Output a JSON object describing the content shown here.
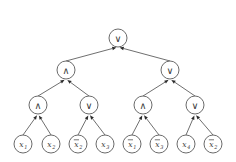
{
  "figure": {
    "background_color": "#ffffff",
    "stroke_color": "#4a4a4a",
    "node_fill": "#ffffff",
    "text_color": "#3a3a3a"
  },
  "symbols": {
    "and": "∧",
    "or": "∨",
    "variable": "x"
  },
  "gates": [
    {
      "id": "root",
      "label": "∨",
      "type": "or",
      "level": 0,
      "cx": 118,
      "cy": 38,
      "r": 9
    },
    {
      "id": "n-l",
      "label": "∧",
      "type": "and",
      "level": 1,
      "cx": 66,
      "cy": 70,
      "r": 9
    },
    {
      "id": "n-r",
      "label": "∨",
      "type": "or",
      "level": 1,
      "cx": 170,
      "cy": 70,
      "r": 9
    },
    {
      "id": "n-ll",
      "label": "∧",
      "type": "and",
      "level": 2,
      "cx": 38,
      "cy": 105,
      "r": 9
    },
    {
      "id": "n-lr",
      "label": "∨",
      "type": "or",
      "level": 2,
      "cx": 89,
      "cy": 105,
      "r": 9
    },
    {
      "id": "n-rl",
      "label": "∧",
      "type": "and",
      "level": 2,
      "cx": 143,
      "cy": 105,
      "r": 9
    },
    {
      "id": "n-rr",
      "label": "∨",
      "type": "or",
      "level": 2,
      "cx": 195,
      "cy": 105,
      "r": 9
    }
  ],
  "leaves": [
    {
      "id": "leaf-1",
      "var": "x",
      "subscript": "1",
      "negated": false,
      "cx": 23,
      "cy": 144,
      "r": 9
    },
    {
      "id": "leaf-2",
      "var": "x",
      "subscript": "2",
      "negated": false,
      "cx": 51,
      "cy": 144,
      "r": 9
    },
    {
      "id": "leaf-3",
      "var": "x",
      "subscript": "2",
      "negated": true,
      "cx": 78,
      "cy": 144,
      "r": 9
    },
    {
      "id": "leaf-4",
      "var": "x",
      "subscript": "3",
      "negated": false,
      "cx": 105,
      "cy": 144,
      "r": 9
    },
    {
      "id": "leaf-5",
      "var": "x",
      "subscript": "1",
      "negated": true,
      "cx": 132,
      "cy": 144,
      "r": 9
    },
    {
      "id": "leaf-6",
      "var": "x",
      "subscript": "3",
      "negated": true,
      "cx": 159,
      "cy": 144,
      "r": 9
    },
    {
      "id": "leaf-7",
      "var": "x",
      "subscript": "4",
      "negated": false,
      "cx": 186,
      "cy": 144,
      "r": 9
    },
    {
      "id": "leaf-8",
      "var": "x",
      "subscript": "2",
      "negated": true,
      "cx": 213,
      "cy": 144,
      "r": 9
    }
  ],
  "edges": [
    {
      "from": "n-l",
      "to": "root"
    },
    {
      "from": "n-r",
      "to": "root"
    },
    {
      "from": "n-ll",
      "to": "n-l"
    },
    {
      "from": "n-lr",
      "to": "n-l"
    },
    {
      "from": "n-rl",
      "to": "n-r"
    },
    {
      "from": "n-rr",
      "to": "n-r"
    },
    {
      "from": "leaf-1",
      "to": "n-ll"
    },
    {
      "from": "leaf-2",
      "to": "n-ll"
    },
    {
      "from": "leaf-3",
      "to": "n-lr"
    },
    {
      "from": "leaf-4",
      "to": "n-lr"
    },
    {
      "from": "leaf-5",
      "to": "n-rl"
    },
    {
      "from": "leaf-6",
      "to": "n-rl"
    },
    {
      "from": "leaf-7",
      "to": "n-rr"
    },
    {
      "from": "leaf-8",
      "to": "n-rr"
    }
  ]
}
